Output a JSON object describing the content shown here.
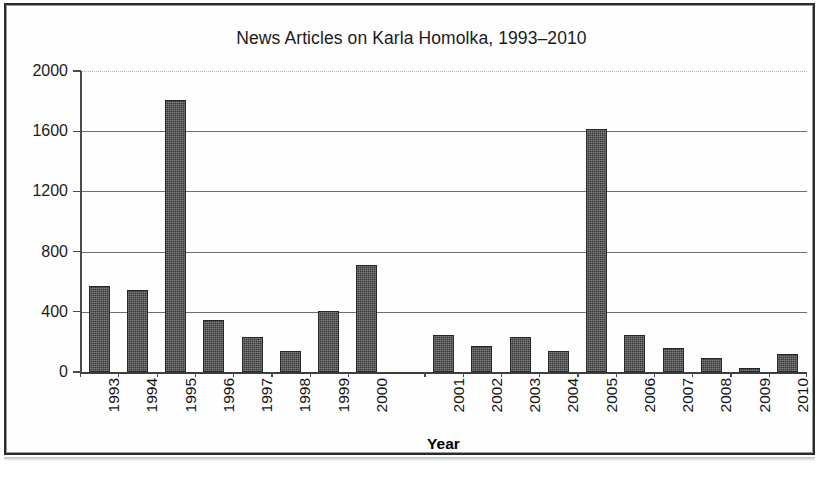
{
  "chart": {
    "title": "News Articles on Karla Homolka, 1993–2010",
    "axis_title_x": "Year"
  },
  "chart_data": {
    "type": "bar",
    "title": "News Articles on Karla Homolka, 1993–2010",
    "xlabel": "Year",
    "ylabel": "",
    "ylim": [
      0,
      2000
    ],
    "yticks": [
      0,
      400,
      800,
      1200,
      1600,
      2000
    ],
    "ytick_labels": [
      "0",
      "400",
      "800",
      "1200",
      "1600",
      "2000"
    ],
    "grid": true,
    "legend": "none",
    "bar_color": "#3a3a3a",
    "group_gap_after": "2000",
    "categories": [
      "1993",
      "1994",
      "1995",
      "1996",
      "1997",
      "1998",
      "1999",
      "2000",
      "2001",
      "2002",
      "2003",
      "2004",
      "2005",
      "2006",
      "2007",
      "2008",
      "2009",
      "2010"
    ],
    "values": [
      570,
      545,
      1810,
      348,
      235,
      140,
      405,
      710,
      245,
      170,
      235,
      140,
      1615,
      245,
      160,
      90,
      25,
      120
    ]
  }
}
